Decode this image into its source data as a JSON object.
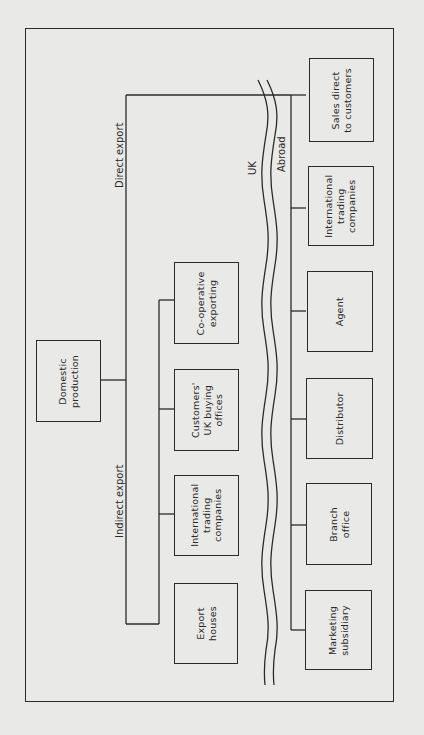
{
  "diagram": {
    "source_node": "Domestic\nproduction",
    "branch_labels": {
      "direct": "Direct export",
      "indirect": "Indirect export"
    },
    "region_labels": {
      "home": "UK",
      "foreign": "Abroad"
    },
    "indirect_nodes": [
      "Co-operative\nexporting",
      "Customers'\nUK buying\noffices",
      "International\ntrading\ncompanies",
      "Export\nhouses"
    ],
    "direct_nodes": [
      "Sales direct\nto customers",
      "International\ntrading\ncompanies",
      "Agent",
      "Distributor",
      "Branch\noffice",
      "Marketing\nsubsidiary"
    ],
    "line_color": "#2a2a2a",
    "background_color": "#e9e9e7"
  }
}
